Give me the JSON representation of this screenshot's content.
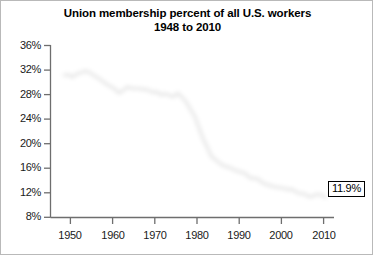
{
  "chart_data": {
    "type": "line",
    "title": "Union membership percent of all U.S. workers",
    "subtitle": "1948 to 2010",
    "xlabel": "",
    "ylabel": "",
    "xlim": [
      1948,
      2011
    ],
    "ylim": [
      8,
      36
    ],
    "ytick_step": 4,
    "grid": false,
    "legend": null,
    "annotations": [
      {
        "text": "11.9%",
        "x": 2010,
        "y": 11.9,
        "style": "boxed-callout-right"
      }
    ],
    "yticks": [
      36,
      32,
      28,
      24,
      20,
      16,
      12,
      8
    ],
    "ytick_labels": [
      "36%",
      "32%",
      "28%",
      "24%",
      "20%",
      "16%",
      "12%",
      "8%"
    ],
    "xticks": [
      1950,
      1960,
      1970,
      1980,
      1990,
      2000,
      2010
    ],
    "xtick_labels": [
      "1950",
      "1960",
      "1970",
      "1980",
      "1990",
      "2000",
      "2010"
    ],
    "line_color": "#1c1c1c",
    "line_width": 2.6,
    "series": [
      {
        "name": "Union membership percent",
        "x": [
          1948,
          1949,
          1950,
          1951,
          1952,
          1953,
          1954,
          1955,
          1956,
          1957,
          1958,
          1959,
          1960,
          1961,
          1962,
          1963,
          1964,
          1965,
          1966,
          1967,
          1968,
          1969,
          1970,
          1971,
          1972,
          1973,
          1974,
          1975,
          1976,
          1977,
          1978,
          1979,
          1980,
          1981,
          1982,
          1983,
          1984,
          1985,
          1986,
          1987,
          1988,
          1989,
          1990,
          1991,
          1992,
          1993,
          1994,
          1995,
          1996,
          1997,
          1998,
          1999,
          2000,
          2001,
          2002,
          2003,
          2004,
          2005,
          2006,
          2007,
          2008,
          2009,
          2010
        ],
        "values": [
          31.8,
          31.9,
          31.5,
          32.0,
          32.2,
          32.5,
          32.3,
          31.8,
          31.4,
          30.9,
          30.4,
          30.0,
          29.6,
          28.9,
          29.3,
          29.9,
          29.7,
          29.6,
          29.6,
          29.5,
          29.4,
          29.0,
          29.1,
          28.6,
          28.8,
          28.5,
          28.3,
          28.9,
          28.2,
          27.4,
          26.2,
          25.1,
          23.2,
          21.4,
          20.0,
          18.5,
          18.0,
          17.4,
          17.0,
          16.8,
          16.5,
          16.2,
          16.0,
          15.8,
          15.1,
          15.0,
          14.9,
          14.3,
          14.0,
          13.8,
          13.6,
          13.5,
          13.4,
          13.2,
          13.2,
          12.8,
          12.5,
          12.5,
          12.0,
          12.1,
          12.4,
          12.3,
          11.9
        ]
      }
    ]
  },
  "figure": {
    "title_line1": "Union membership percent of all U.S. workers",
    "title_line2": "1948 to 2010",
    "callout_label": "11.9%"
  }
}
